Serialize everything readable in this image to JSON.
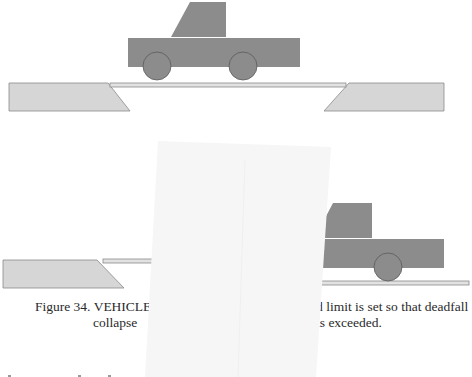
{
  "figure": {
    "colors": {
      "truck_fill": "#8c8c8c",
      "truck_stroke": "#6a6a6a",
      "ramp_fill": "#d6d6d6",
      "ramp_stroke": "#8a8a8a",
      "platform_fill": "#e2e2e2",
      "occluder_fill": "#f6f6f6",
      "text_color": "#2a2a2a"
    },
    "panels": [
      {
        "name": "before",
        "state": "vehicle on platform, deadfall intact"
      },
      {
        "name": "after",
        "state": "deadfall collapsed, vehicle dropped"
      }
    ]
  },
  "caption": {
    "line1_left": "Figure 34. VEHICLE I",
    "line2_left": "collapse",
    "line1_right": "d limit is set so that deadfall",
    "line2_right": "is exceeded."
  }
}
